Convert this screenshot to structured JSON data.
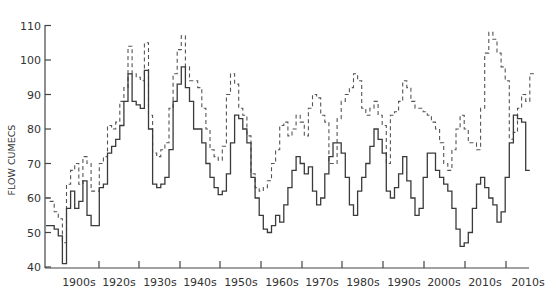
{
  "chart_data": {
    "type": "line",
    "subtype": "step",
    "title": "",
    "xlabel": "",
    "ylabel": "FLOW CUMECS",
    "ylim": [
      40,
      110
    ],
    "yticks": [
      40,
      50,
      60,
      70,
      80,
      90,
      100,
      110
    ],
    "xtick_labels": [
      "1900s",
      "1920s",
      "1930s",
      "1940s",
      "1950s",
      "1960s",
      "1970s",
      "1980s",
      "1990s",
      "2000s",
      "2010s",
      "2010s"
    ],
    "grid": false,
    "legend": null,
    "x_start_year": 1895,
    "step_years": 1,
    "series": [
      {
        "name": "solid",
        "style": "solid",
        "values": [
          52,
          52,
          51,
          49,
          41,
          57,
          62,
          57,
          59,
          65,
          55,
          52,
          52,
          63,
          64,
          73,
          75,
          77,
          81,
          88,
          96,
          88,
          87,
          86,
          97,
          80,
          64,
          63,
          64,
          66,
          74,
          88,
          93,
          98,
          92,
          88,
          80,
          80,
          76,
          70,
          66,
          63,
          61,
          62,
          67,
          76,
          84,
          83,
          80,
          76,
          66,
          60,
          55,
          51,
          50,
          52,
          55,
          53,
          58,
          63,
          68,
          72,
          70,
          67,
          69,
          62,
          58,
          60,
          67,
          72,
          76,
          76,
          73,
          66,
          58,
          55,
          62,
          66,
          70,
          75,
          80,
          77,
          73,
          62,
          60,
          63,
          67,
          72,
          65,
          60,
          55,
          57,
          66,
          73,
          73,
          68,
          66,
          64,
          62,
          57,
          51,
          46,
          47,
          50,
          57,
          64,
          66,
          63,
          60,
          58,
          53,
          56,
          66,
          76,
          84,
          83,
          82,
          68
        ]
      },
      {
        "name": "dashed",
        "style": "dashed",
        "values": [
          60,
          59,
          56,
          54,
          47,
          64,
          68,
          70,
          64,
          72,
          70,
          62,
          62,
          70,
          72,
          81,
          80,
          82,
          88,
          92,
          104,
          96,
          95,
          94,
          105,
          84,
          73,
          72,
          74,
          76,
          86,
          96,
          103,
          107,
          98,
          94,
          94,
          92,
          86,
          80,
          74,
          72,
          71,
          75,
          90,
          96,
          93,
          86,
          84,
          78,
          67,
          63,
          62,
          63,
          65,
          70,
          74,
          81,
          82,
          78,
          80,
          84,
          82,
          78,
          86,
          90,
          89,
          84,
          82,
          70,
          70,
          83,
          88,
          90,
          92,
          96,
          94,
          86,
          84,
          86,
          88,
          84,
          81,
          70,
          84,
          85,
          88,
          94,
          92,
          88,
          86,
          86,
          85,
          84,
          82,
          80,
          76,
          70,
          68,
          74,
          80,
          84,
          80,
          76,
          76,
          74,
          86,
          102,
          108,
          106,
          102,
          98,
          94,
          77,
          79,
          86,
          90,
          88,
          96
        ]
      }
    ]
  },
  "axes": {
    "y_title": "FLOW CUMECS",
    "y_ticks": [
      "40",
      "50",
      "60",
      "70",
      "80",
      "90",
      "100",
      "110"
    ],
    "x_ticks": [
      "1900s",
      "1920s",
      "1930s",
      "1940s",
      "1950s",
      "1960s",
      "1970s",
      "1980s",
      "1990s",
      "2000s",
      "2010s",
      "2010s"
    ]
  }
}
